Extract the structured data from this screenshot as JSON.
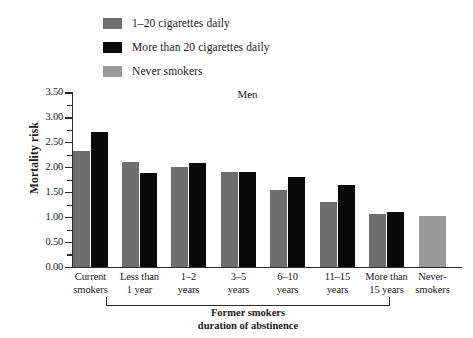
{
  "legend": {
    "items": [
      {
        "label": "1–20 cigarettes daily",
        "color": "#6e6e6e",
        "swatch_name": "legend-swatch-light-smokers"
      },
      {
        "label": "More than 20 cigarettes daily",
        "color": "#0a0a0a",
        "swatch_name": "legend-swatch-heavy-smokers"
      },
      {
        "label": "Never smokers",
        "color": "#999999",
        "swatch_name": "legend-swatch-never-smokers"
      }
    ]
  },
  "chart_data": {
    "type": "bar",
    "title": "Men",
    "xlabel": "Former smokers duration of abstinence",
    "ylabel": "Mortality risk",
    "ylim": [
      0.0,
      3.5
    ],
    "ytick_labels": [
      "0.00",
      "0.50",
      "1.00",
      "1.50",
      "2.00",
      "2.50",
      "3.00",
      "3.50"
    ],
    "ytick_values": [
      0.0,
      0.5,
      1.0,
      1.5,
      2.0,
      2.5,
      3.0,
      3.5
    ],
    "minor_ticks": true,
    "grid": false,
    "legend_position": "top-left",
    "categories": [
      "Current smokers",
      "Less than 1 year",
      "1–2 years",
      "3–5 years",
      "6–10 years",
      "11–15 years",
      "More than 15 years",
      "Never-smokers"
    ],
    "category_lines": [
      [
        "Current",
        "smokers"
      ],
      [
        "Less than",
        "1 year"
      ],
      [
        "1–2",
        "years"
      ],
      [
        "3–5",
        "years"
      ],
      [
        "6–10",
        "years"
      ],
      [
        "11–15",
        "years"
      ],
      [
        "More than",
        "15 years"
      ],
      [
        "Never-",
        "smokers"
      ]
    ],
    "series": [
      {
        "name": "1–20 cigarettes daily",
        "color": "#6e6e6e",
        "values": [
          2.34,
          2.12,
          2.02,
          1.92,
          1.56,
          1.32,
          1.08,
          null
        ]
      },
      {
        "name": "More than 20 cigarettes daily",
        "color": "#0a0a0a",
        "values": [
          2.72,
          1.9,
          2.1,
          1.92,
          1.82,
          1.66,
          1.12,
          null
        ]
      },
      {
        "name": "Never smokers",
        "color": "#999999",
        "values": [
          null,
          null,
          null,
          null,
          null,
          null,
          null,
          1.04
        ]
      }
    ],
    "group_bracket": {
      "label_lines": [
        "Former smokers",
        "duration of abstinence"
      ],
      "spans": [
        "Less than 1 year",
        "More than 15 years"
      ]
    }
  }
}
